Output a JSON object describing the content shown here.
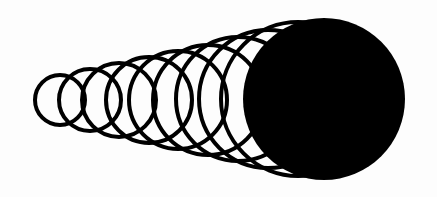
{
  "figure": {
    "width": 437,
    "height": 197,
    "background": "#fdfdfd",
    "stroke_color": "#000000",
    "fill_color": "#000000",
    "stroke_width": 4
  },
  "outlined_circles": [
    {
      "cx": 60,
      "cy": 100,
      "r": 25
    },
    {
      "cx": 90,
      "cy": 100,
      "r": 31
    },
    {
      "cx": 119,
      "cy": 100,
      "r": 37
    },
    {
      "cx": 149,
      "cy": 100,
      "r": 43
    },
    {
      "cx": 178,
      "cy": 100,
      "r": 49
    },
    {
      "cx": 208,
      "cy": 100,
      "r": 55
    },
    {
      "cx": 238,
      "cy": 99,
      "r": 62
    },
    {
      "cx": 268,
      "cy": 99,
      "r": 69
    },
    {
      "cx": 298,
      "cy": 99,
      "r": 77
    }
  ],
  "filled_circle": {
    "cx": 324,
    "cy": 99,
    "r": 81
  }
}
